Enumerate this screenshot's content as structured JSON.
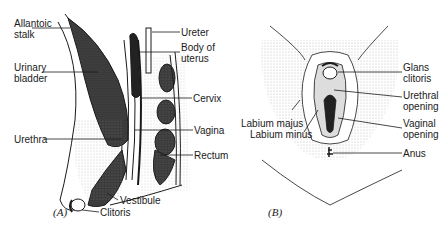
{
  "panel_a": {
    "caption": "(A)",
    "labels": {
      "allantoic_1": "Allantoic",
      "allantoic_2": "stalk",
      "urinary_1": "Urinary",
      "urinary_2": "bladder",
      "urethra": "Urethra",
      "ureter": "Ureter",
      "body_1": "Body of",
      "body_2": "uterus",
      "cervix": "Cervix",
      "vagina": "Vagina",
      "rectum": "Rectum",
      "vestibule": "Vestibule",
      "clitoris": "Clitoris"
    }
  },
  "panel_b": {
    "caption": "(B)",
    "labels": {
      "glans_1": "Glans",
      "glans_2": "clitoris",
      "urethral_1": "Urethral",
      "urethral_2": "opening",
      "labium_majus": "Labium majus",
      "labium_minus": "Labium minus",
      "vaginal_1": "Vaginal",
      "vaginal_2": "opening",
      "anus": "Anus"
    }
  },
  "colors": {
    "ink": "#1a1a1a",
    "stipple": "#9a9a9a",
    "dark_fill": "#3a3a3a"
  }
}
